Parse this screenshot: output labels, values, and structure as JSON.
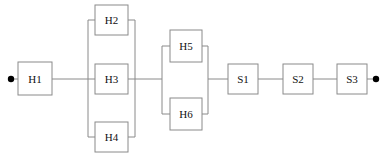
{
  "diagram": {
    "type": "reliability-block-diagram",
    "canvas": {
      "width": 388,
      "height": 163
    },
    "colors": {
      "background": "#ffffff",
      "block_stroke": "#8a8a8a",
      "block_fill": "#ffffff",
      "link_stroke": "#8a8a8a",
      "terminal_fill": "#000000",
      "label_color": "#111111"
    },
    "terminals": [
      {
        "name": "input-terminal",
        "cx": 11,
        "cy": 79,
        "r": 3.2
      },
      {
        "name": "output-terminal",
        "cx": 376,
        "cy": 79,
        "r": 3.2
      }
    ],
    "blocks": [
      {
        "id": "H1",
        "label": "H1",
        "x": 18,
        "y": 62,
        "w": 34,
        "h": 33,
        "group": "series-head"
      },
      {
        "id": "H2",
        "label": "H2",
        "x": 95,
        "y": 5,
        "w": 33,
        "h": 30,
        "group": "parallel-A"
      },
      {
        "id": "H3",
        "label": "H3",
        "x": 95,
        "y": 64,
        "w": 33,
        "h": 30,
        "group": "parallel-A"
      },
      {
        "id": "H4",
        "label": "H4",
        "x": 95,
        "y": 122,
        "w": 33,
        "h": 30,
        "group": "parallel-A"
      },
      {
        "id": "H5",
        "label": "H5",
        "x": 170,
        "y": 30,
        "w": 32,
        "h": 32,
        "group": "parallel-B"
      },
      {
        "id": "H6",
        "label": "H6",
        "x": 170,
        "y": 98,
        "w": 32,
        "h": 32,
        "group": "parallel-B"
      },
      {
        "id": "S1",
        "label": "S1",
        "x": 228,
        "y": 64,
        "w": 30,
        "h": 30,
        "group": "series-tail"
      },
      {
        "id": "S2",
        "label": "S2",
        "x": 283,
        "y": 64,
        "w": 30,
        "h": 30,
        "group": "series-tail"
      },
      {
        "id": "S3",
        "label": "S3",
        "x": 337,
        "y": 64,
        "w": 30,
        "h": 30,
        "group": "series-tail"
      }
    ],
    "links": [
      {
        "name": "link-input-to-h1",
        "d": "M 11 79 L 18 79"
      },
      {
        "name": "link-h1-to-bus-a-left",
        "d": "M 52 79 L 95 79"
      },
      {
        "name": "bus-a-left-vertical",
        "d": "M 88 20 L 88 137"
      },
      {
        "name": "bus-a-left-stub-h2",
        "d": "M 88 20 L 95 20"
      },
      {
        "name": "bus-a-left-stub-h4",
        "d": "M 88 137 L 95 137"
      },
      {
        "name": "bus-a-right-vertical",
        "d": "M 135 20 L 135 137"
      },
      {
        "name": "bus-a-right-stub-h2",
        "d": "M 128 20 L 135 20"
      },
      {
        "name": "bus-a-right-stub-h3",
        "d": "M 128 79 L 135 79"
      },
      {
        "name": "bus-a-right-stub-h4",
        "d": "M 128 137 L 135 137"
      },
      {
        "name": "link-bus-a-to-bus-b",
        "d": "M 135 79 L 162 79"
      },
      {
        "name": "bus-b-left-vertical",
        "d": "M 162 46 L 162 114"
      },
      {
        "name": "bus-b-left-stub-h5",
        "d": "M 162 46 L 170 46"
      },
      {
        "name": "bus-b-left-stub-h6",
        "d": "M 162 114 L 170 114"
      },
      {
        "name": "bus-b-right-vertical",
        "d": "M 208 46 L 208 114"
      },
      {
        "name": "bus-b-right-stub-h5",
        "d": "M 202 46 L 208 46"
      },
      {
        "name": "bus-b-right-stub-h6",
        "d": "M 202 114 L 208 114"
      },
      {
        "name": "link-bus-b-to-s1",
        "d": "M 208 79 L 228 79"
      },
      {
        "name": "link-s1-to-s2",
        "d": "M 258 79 L 283 79"
      },
      {
        "name": "link-s2-to-s3",
        "d": "M 313 79 L 337 79"
      },
      {
        "name": "link-s3-to-output",
        "d": "M 367 79 L 376 79"
      }
    ]
  }
}
